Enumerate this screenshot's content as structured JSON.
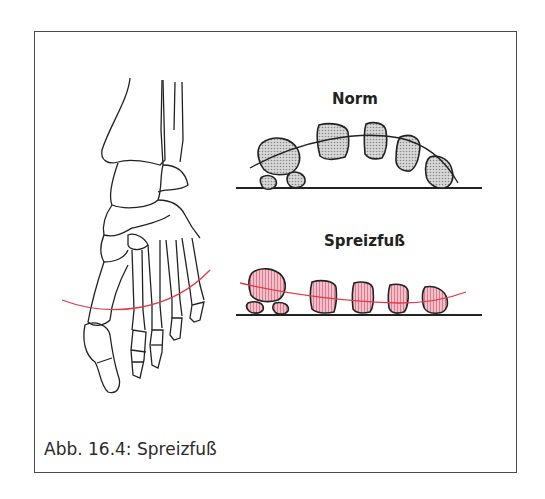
{
  "figure": {
    "caption": "Abb. 16.4: Spreizfuß",
    "panels": [
      {
        "title": "Norm",
        "fill_color": "#c8c8c8",
        "arch_line_color": "#222222",
        "description": "normal transverse arch"
      },
      {
        "title": "Spreizfuß",
        "fill_color": "#eaa3b3",
        "arch_line_color": "#e03a4c",
        "description": "splayfoot, flattened transverse arch"
      }
    ],
    "foot_drawing": {
      "description": "skeleton of foot, dorsal view",
      "arch_line_color": "#e03a4c"
    },
    "colors": {
      "frame": "#4a4a4a",
      "outline": "#222222",
      "red_line": "#e03a4c",
      "pink_fill": "#eaa3b3",
      "gray_fill": "#c4c4c4"
    }
  }
}
